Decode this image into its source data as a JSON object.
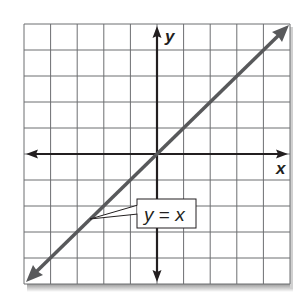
{
  "chart_data": {
    "type": "line",
    "title": "",
    "xlabel": "x",
    "ylabel": "y",
    "xlim": [
      -5,
      5
    ],
    "ylim": [
      -5,
      5
    ],
    "grid": true,
    "grid_step": 1,
    "series": [
      {
        "name": "y = x",
        "equation": "y = x",
        "x": [
          -5,
          5
        ],
        "y": [
          -5,
          5
        ],
        "color": "#58595b",
        "arrows": "both"
      }
    ],
    "annotations": [
      {
        "text": "y = x",
        "points_to": [
          -3.5,
          -2.5
        ]
      }
    ]
  },
  "labels": {
    "x_axis": "x",
    "y_axis": "y",
    "equation_y": "y",
    "equation_eq": " = ",
    "equation_x": "x"
  },
  "colors": {
    "grid": "#6d6e71",
    "axis": "#231f20",
    "line": "#58595b",
    "shadow": "#bcbec0"
  }
}
